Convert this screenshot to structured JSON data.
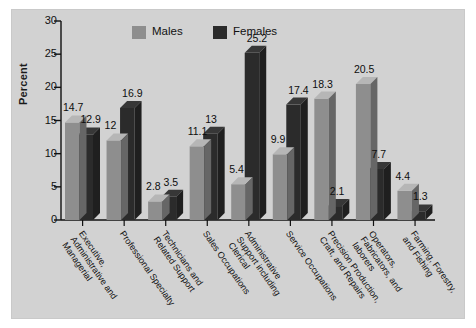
{
  "figure": {
    "background": "#ffffff",
    "panel_background": "#d2d2d2"
  },
  "legend": {
    "position": "top-left-inside",
    "entries": [
      {
        "label": "Males",
        "color": "#8e8e8e",
        "icon": "legend-swatch-icon"
      },
      {
        "label": "Females",
        "color": "#2b2b2b",
        "icon": "legend-swatch-icon"
      }
    ]
  },
  "axes": {
    "ylabel": "Percent",
    "yticks": [
      "0",
      "5",
      "10",
      "15",
      "20",
      "25",
      "30"
    ],
    "ylim_min": 0,
    "ylim_max": 30
  },
  "chart_data": {
    "type": "bar",
    "title": "",
    "subtitle": "",
    "xlabel": "",
    "ylabel": "Percent",
    "ylim": [
      0,
      30
    ],
    "grid": false,
    "legend_position": "upper left",
    "style": "3d grouped vertical bars",
    "categories": [
      "Executive,\nAdministrative and\nManagerial",
      "Professional Specialty",
      "Technicians and\nRelated Support",
      "Sales Occupations",
      "Administrative\nSupport including\nClerical",
      "Service Occupations",
      "Precision Production,\nCraft, and Repairs",
      "Operators,\nFabricators, and\nlaborers",
      "Farming, Forestry,\nand Fishing"
    ],
    "series": [
      {
        "name": "Males",
        "color": "#8e8e8e",
        "values": [
          14.7,
          12,
          2.8,
          11.1,
          5.4,
          9.9,
          18.3,
          20.5,
          4.4
        ]
      },
      {
        "name": "Females",
        "color": "#2b2b2b",
        "values": [
          12.9,
          16.9,
          3.5,
          13,
          25.2,
          17.4,
          2.1,
          7.7,
          1.3
        ]
      }
    ],
    "data_labels": [
      "14.7",
      "12.9",
      "12",
      "16.9",
      "2.8",
      "3.5",
      "11.1",
      "13",
      "5.4",
      "25.2",
      "9.9",
      "17.4",
      "18.3",
      "2.1",
      "20.5",
      "7.7",
      "4.4",
      "1.3"
    ]
  }
}
